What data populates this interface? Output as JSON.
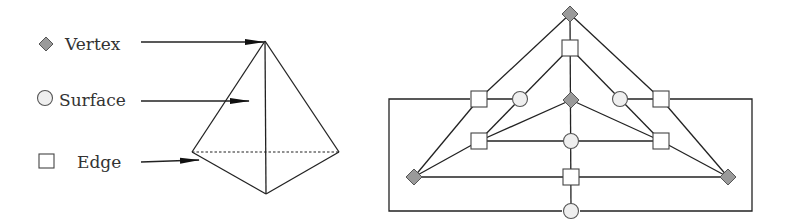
{
  "legend": {
    "items": [
      {
        "symbol": "diamond-icon",
        "label": "Vertex"
      },
      {
        "symbol": "circle-icon",
        "label": "Surface"
      },
      {
        "symbol": "square-icon",
        "label": "Edge"
      }
    ]
  },
  "colors": {
    "vertex_fill": "#9a9a9a",
    "surface_fill": "#efefef",
    "edge_fill": "#ffffff",
    "line": "#222222"
  },
  "tetrahedron": {
    "vertices": {
      "apex": [
        265,
        41
      ],
      "left": [
        192,
        152
      ],
      "right": [
        339,
        152
      ],
      "front": [
        266,
        194
      ]
    },
    "hidden_edge": "left-right (dashed)"
  },
  "graph": {
    "vertex_nodes": [
      [
        570,
        14
      ],
      [
        571,
        100
      ],
      [
        414,
        177
      ],
      [
        728,
        177
      ]
    ],
    "surface_nodes": [
      [
        520,
        99
      ],
      [
        620,
        99
      ],
      [
        571,
        141
      ],
      [
        571,
        211
      ]
    ],
    "edge_nodes": [
      [
        570,
        48
      ],
      [
        479,
        99
      ],
      [
        661,
        99
      ],
      [
        479,
        141
      ],
      [
        661,
        141
      ],
      [
        571,
        177
      ]
    ]
  }
}
